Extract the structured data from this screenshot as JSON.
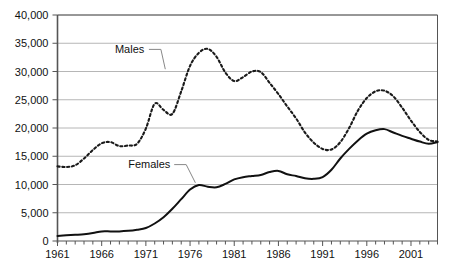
{
  "chart_data": {
    "type": "line",
    "title": "",
    "subtitle": "",
    "xlabel": "",
    "ylabel": "",
    "xlim": [
      1961,
      2004
    ],
    "ylim": [
      0,
      40000
    ],
    "grid": true,
    "legend_position": "inline-annotations",
    "yticks": [
      "0",
      "5,000",
      "10,000",
      "15,000",
      "20,000",
      "25,000",
      "30,000",
      "35,000",
      "40,000"
    ],
    "ytick_values": [
      0,
      5000,
      10000,
      15000,
      20000,
      25000,
      30000,
      35000,
      40000
    ],
    "xticks": [
      "1961",
      "1966",
      "1971",
      "1976",
      "1981",
      "1986",
      "1991",
      "1996",
      "2001"
    ],
    "xtick_values": [
      1961,
      1966,
      1971,
      1976,
      1981,
      1986,
      1991,
      1996,
      2001
    ],
    "x": [
      1961,
      1962,
      1963,
      1964,
      1965,
      1966,
      1967,
      1968,
      1969,
      1970,
      1971,
      1972,
      1973,
      1974,
      1975,
      1976,
      1977,
      1978,
      1979,
      1980,
      1981,
      1982,
      1983,
      1984,
      1985,
      1986,
      1987,
      1988,
      1989,
      1990,
      1991,
      1992,
      1993,
      1994,
      1995,
      1996,
      1997,
      1998,
      1999,
      2000,
      2001,
      2002,
      2003,
      2004
    ],
    "series": [
      {
        "name": "Males",
        "style": "dotted",
        "color": "#1a1a1a",
        "label_anchor": {
          "x": 1967.5,
          "y": 33300
        },
        "values": [
          13200,
          13100,
          13400,
          14600,
          16100,
          17300,
          17500,
          16800,
          16900,
          17200,
          19900,
          24300,
          23200,
          22500,
          26500,
          31000,
          33300,
          34000,
          32600,
          29800,
          28300,
          29000,
          30000,
          29900,
          28000,
          26000,
          23800,
          21700,
          19200,
          17400,
          16300,
          16200,
          17500,
          20000,
          23100,
          25300,
          26500,
          26600,
          25600,
          23600,
          21300,
          19300,
          17900,
          17600
        ]
      },
      {
        "name": "Females",
        "style": "solid",
        "color": "#111111",
        "label_anchor": {
          "x": 1972.5,
          "y": 12600
        },
        "values": [
          900,
          1000,
          1100,
          1200,
          1400,
          1700,
          1700,
          1700,
          1800,
          2000,
          2300,
          3100,
          4200,
          5700,
          7400,
          9100,
          9900,
          9600,
          9500,
          10100,
          10900,
          11300,
          11500,
          11700,
          12200,
          12400,
          11800,
          11500,
          11100,
          11000,
          11300,
          12600,
          14600,
          16300,
          17800,
          19000,
          19600,
          19800,
          19200,
          18600,
          18100,
          17600,
          17200,
          17500
        ]
      }
    ],
    "annotations": [
      {
        "text": "Males",
        "x": 1967.5,
        "y": 33300,
        "leader_to": {
          "x": 1973.2,
          "y": 30400
        }
      },
      {
        "text": "Females",
        "x": 1969.0,
        "y": 12900,
        "leader_to": {
          "x": 1976.6,
          "y": 10300
        }
      }
    ]
  },
  "colors": {
    "plot_border": "#555555",
    "gridline": "#b6b6b6",
    "axis_line": "#555555",
    "tick": "#555555",
    "text": "#111111",
    "background": "#ffffff",
    "males_line": "#1a1a1a",
    "females_line": "#111111",
    "leader": "#888888"
  }
}
